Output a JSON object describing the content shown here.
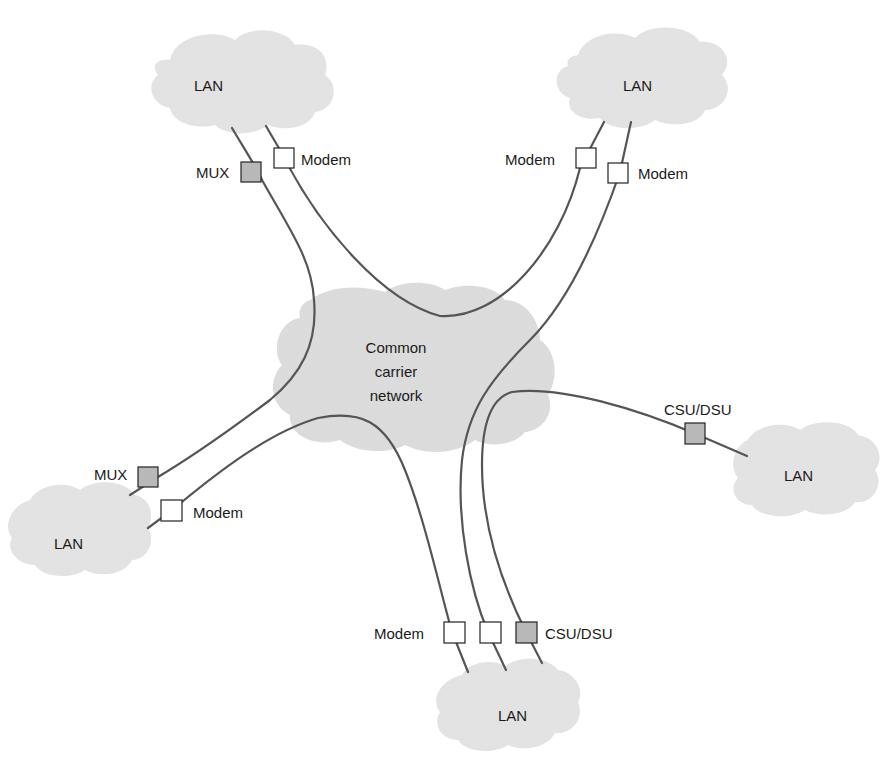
{
  "diagram": {
    "title": "",
    "colors": {
      "background": "#ffffff",
      "cloud_fill": "#e4e4e4",
      "center_cloud_fill": "#dddddd",
      "link_stroke": "#555555",
      "device_border": "#222222",
      "device_plain_fill": "#ffffff",
      "device_shaded_fill": "#b8b8b8"
    },
    "center_cloud": {
      "lines": [
        "Common",
        "carrier",
        "network"
      ]
    },
    "lans": [
      {
        "id": "lan-top-left",
        "label": "LAN"
      },
      {
        "id": "lan-top-right",
        "label": "LAN"
      },
      {
        "id": "lan-right",
        "label": "LAN"
      },
      {
        "id": "lan-bottom-left",
        "label": "LAN"
      },
      {
        "id": "lan-bottom",
        "label": "LAN"
      }
    ],
    "devices": [
      {
        "id": "mux-top-left",
        "type": "MUX",
        "label": "MUX",
        "shaded": true
      },
      {
        "id": "modem-top-left",
        "type": "Modem",
        "label": "Modem",
        "shaded": false
      },
      {
        "id": "modem-top-right-1",
        "type": "Modem",
        "label": "Modem",
        "shaded": false
      },
      {
        "id": "modem-top-right-2",
        "type": "Modem",
        "label": "Modem",
        "shaded": false
      },
      {
        "id": "csudsu-right",
        "type": "CSU/DSU",
        "label": "CSU/DSU",
        "shaded": true
      },
      {
        "id": "mux-bottom-left",
        "type": "MUX",
        "label": "MUX",
        "shaded": true
      },
      {
        "id": "modem-bottom-left",
        "type": "Modem",
        "label": "Modem",
        "shaded": false
      },
      {
        "id": "modem-bottom-1",
        "type": "Modem",
        "label": "Modem",
        "shaded": false
      },
      {
        "id": "modem-bottom-2",
        "type": "Modem",
        "label": "",
        "shaded": false
      },
      {
        "id": "csudsu-bottom",
        "type": "CSU/DSU",
        "label": "CSU/DSU",
        "shaded": true
      }
    ],
    "links": [
      {
        "from": "lan-top-left",
        "via": [
          "mux-top-left",
          "mux-bottom-left"
        ],
        "to": "lan-bottom-left"
      },
      {
        "from": "lan-top-left",
        "via": [
          "modem-top-left",
          "modem-top-right-1"
        ],
        "to": "lan-top-right"
      },
      {
        "from": "lan-top-right",
        "via": [
          "modem-top-right-2",
          "modem-bottom-2"
        ],
        "to": "lan-bottom"
      },
      {
        "from": "lan-right",
        "via": [
          "csudsu-right",
          "csudsu-bottom"
        ],
        "to": "lan-bottom"
      },
      {
        "from": "lan-bottom-left",
        "via": [
          "modem-bottom-left",
          "modem-bottom-1"
        ],
        "to": "lan-bottom"
      }
    ]
  }
}
